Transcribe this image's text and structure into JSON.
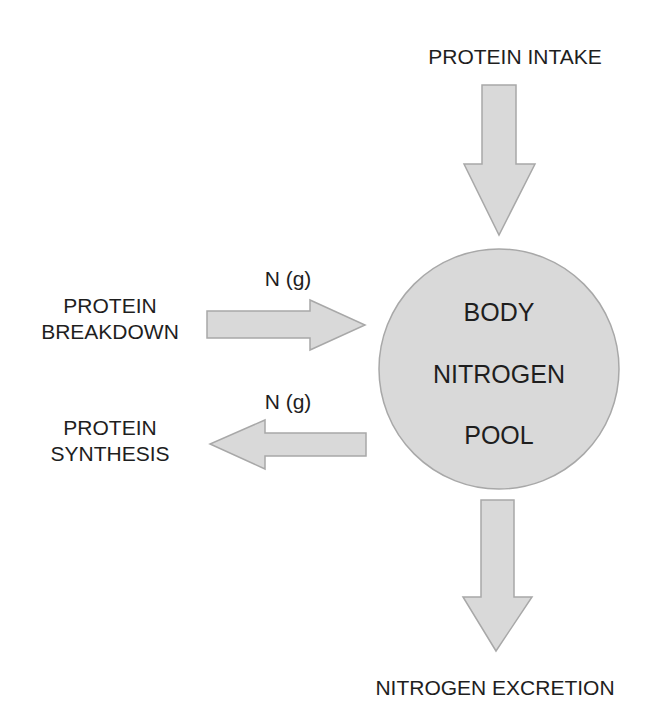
{
  "diagram": {
    "colors": {
      "shape_fill": "#d9d9d9",
      "shape_stroke": "#a8a8a8",
      "text": "#1e1e1e",
      "background": "#ffffff"
    },
    "nodes": {
      "pool": {
        "lines": [
          "BODY",
          "NITROGEN",
          "POOL"
        ]
      },
      "intake": {
        "label": "PROTEIN INTAKE"
      },
      "breakdown": {
        "lines": [
          "PROTEIN",
          "BREAKDOWN"
        ]
      },
      "synthesis": {
        "lines": [
          "PROTEIN",
          "SYNTHESIS"
        ]
      },
      "excretion": {
        "label": "NITROGEN EXCRETION"
      }
    },
    "edges": [
      {
        "from": "intake",
        "to": "pool",
        "direction": "down",
        "label": ""
      },
      {
        "from": "breakdown",
        "to": "pool",
        "direction": "right",
        "label": "N (g)"
      },
      {
        "from": "pool",
        "to": "synthesis",
        "direction": "left",
        "label": "N (g)"
      },
      {
        "from": "pool",
        "to": "excretion",
        "direction": "down",
        "label": ""
      }
    ]
  }
}
